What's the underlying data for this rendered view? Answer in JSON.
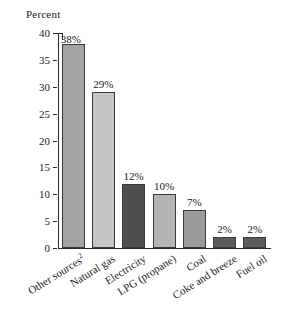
{
  "chart_data": {
    "type": "bar",
    "title": "",
    "subtitle": "",
    "xlabel": "",
    "ylabel": "Percent",
    "ylim": [
      0,
      40
    ],
    "ytick_labels": [
      "0",
      "5",
      "10",
      "15",
      "20",
      "25",
      "30",
      "35",
      "40"
    ],
    "ytick_values": [
      0,
      5,
      10,
      15,
      20,
      25,
      30,
      35,
      40
    ],
    "grid": false,
    "legend": "none",
    "categories": [
      "Other sources",
      "Natural gas",
      "Electricity",
      "LPG (propane)",
      "Coal",
      "Coke and breeze",
      "Fuel oil"
    ],
    "category_footnote_marker": "2",
    "values": [
      38,
      29,
      12,
      10,
      7,
      2,
      2
    ],
    "data_labels": [
      "38%",
      "29%",
      "12%",
      "10%",
      "7%",
      "2%",
      "2%"
    ],
    "bar_fill_colors": [
      "#a3a3a3",
      "#c5c5c5",
      "#4f4f4f",
      "#b4b4b4",
      "#9a9a9a",
      "#5c5c5c",
      "#5c5c5c"
    ],
    "bar_edge_color": "#3a3a3a",
    "axis_color": "#2b2b2b",
    "background_color": "#ffffff"
  },
  "axis": {
    "y_title": "Percent"
  },
  "categories_display": [
    {
      "text": "Other sources",
      "sup": "2"
    },
    {
      "text": "Natural gas",
      "sup": ""
    },
    {
      "text": "Electricity",
      "sup": ""
    },
    {
      "text": "LPG (propane)",
      "sup": ""
    },
    {
      "text": "Coal",
      "sup": ""
    },
    {
      "text": "Coke and breeze",
      "sup": ""
    },
    {
      "text": "Fuel oil",
      "sup": ""
    }
  ]
}
